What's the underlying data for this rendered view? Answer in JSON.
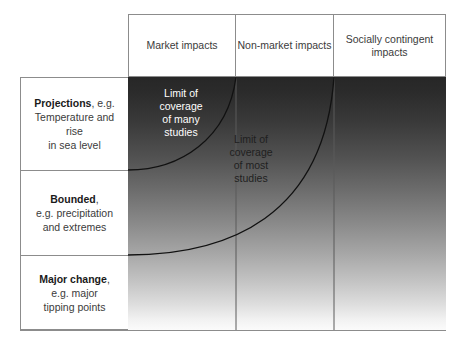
{
  "diagram": {
    "columns": [
      {
        "id": "market",
        "lines": [
          "Market",
          "impacts"
        ]
      },
      {
        "id": "non-market",
        "lines": [
          "Non-market",
          "impacts"
        ]
      },
      {
        "id": "socially-contingent",
        "lines": [
          "Socially",
          "contingent",
          "impacts"
        ]
      }
    ],
    "rows": [
      {
        "id": "projections",
        "title": "Projections",
        "title_suffix": ", e.g.",
        "detail_lines": [
          "Temperature and rise",
          "in sea level"
        ]
      },
      {
        "id": "bounded",
        "title": "Bounded",
        "title_suffix": ",",
        "detail_lines": [
          "e.g. precipitation",
          "and extremes"
        ]
      },
      {
        "id": "major-change",
        "title": "Major change",
        "title_suffix": ",",
        "detail_lines": [
          "e.g. major",
          "tipping points"
        ]
      }
    ],
    "annotations": [
      {
        "id": "limit-many-studies",
        "lines": [
          "Limit of",
          "coverage",
          "of many",
          "studies"
        ],
        "color": "#ffffff"
      },
      {
        "id": "limit-most-studies",
        "lines": [
          "Limit of",
          "coverage",
          "of most",
          "studies"
        ],
        "color": "#1f1f1f"
      }
    ],
    "colors": {
      "gradient_top": "#272727",
      "gradient_bottom": "#fbfbfb",
      "border": "#8c8c8c",
      "curve": "#111111",
      "text": "#3b3b3b",
      "text_strong": "#1a1a1a"
    }
  }
}
